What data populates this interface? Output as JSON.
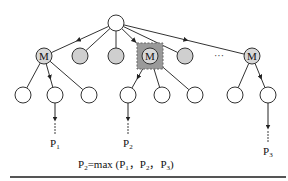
{
  "diagram": {
    "node_letter": "M",
    "ellipsis": "···",
    "colors": {
      "stroke": "#333333",
      "gray_fill": "#cfcfcf",
      "selected_box": "#9a9a9a",
      "rule": "#555555"
    },
    "root": {
      "x": 116,
      "y": 23,
      "r": 8
    },
    "level1": [
      {
        "x": 44,
        "y": 56,
        "type": "M"
      },
      {
        "x": 80,
        "y": 56,
        "type": "gray"
      },
      {
        "x": 116,
        "y": 56,
        "type": "gray"
      },
      {
        "x": 150,
        "y": 56,
        "type": "M",
        "selected": true
      },
      {
        "x": 185,
        "y": 56,
        "type": "gray"
      },
      {
        "x": 252,
        "y": 56,
        "type": "M"
      }
    ],
    "level2": [
      {
        "x": 23,
        "y": 95,
        "parent": 0
      },
      {
        "x": 55,
        "y": 95,
        "parent": 0,
        "arrow": true
      },
      {
        "x": 89,
        "y": 95,
        "parent": 0
      },
      {
        "x": 128,
        "y": 95,
        "parent": 3,
        "arrow": true
      },
      {
        "x": 162,
        "y": 95,
        "parent": 3
      },
      {
        "x": 195,
        "y": 95,
        "parent": 3
      },
      {
        "x": 235,
        "y": 95,
        "parent": 5
      },
      {
        "x": 268,
        "y": 95,
        "parent": 5,
        "arrow": true
      }
    ],
    "paths": [
      {
        "from_x": 55,
        "label": "P",
        "sub": "1",
        "label_y": 144
      },
      {
        "from_x": 128,
        "label": "P",
        "sub": "2",
        "label_y": 144
      },
      {
        "from_x": 268,
        "label": "P",
        "sub": "3",
        "label_y": 152
      }
    ],
    "formula": {
      "lhs": "P",
      "lhs_sub": "2",
      "eq": "=max (",
      "args": [
        {
          "p": "P",
          "sub": "1"
        },
        {
          "p": "P",
          "sub": "2"
        },
        {
          "p": "P",
          "sub": "3"
        }
      ],
      "sep": "，",
      "close": ")"
    }
  }
}
